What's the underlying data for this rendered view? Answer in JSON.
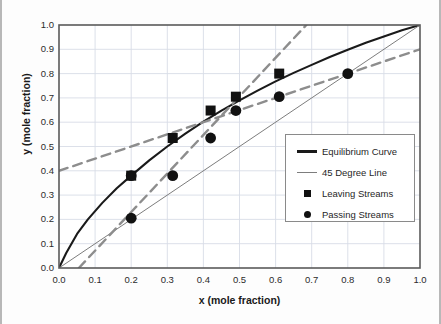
{
  "chart_data": {
    "type": "line",
    "title": "",
    "xlabel": "x (mole fraction)",
    "ylabel": "y (mole fraction)",
    "xlim": [
      0.0,
      1.0
    ],
    "ylim": [
      0.0,
      1.0
    ],
    "grid": true,
    "legend_position": "center-right",
    "xticks": [
      "0.0",
      "0.1",
      "0.2",
      "0.3",
      "0.4",
      "0.5",
      "0.6",
      "0.7",
      "0.8",
      "0.9",
      "1.0"
    ],
    "yticks": [
      "0.0",
      "0.1",
      "0.2",
      "0.3",
      "0.4",
      "0.5",
      "0.6",
      "0.7",
      "0.8",
      "0.9",
      "1.0"
    ],
    "xtick_values": [
      0.0,
      0.1,
      0.2,
      0.3,
      0.4,
      0.5,
      0.6,
      0.7,
      0.8,
      0.9,
      1.0
    ],
    "ytick_values": [
      0.0,
      0.1,
      0.2,
      0.3,
      0.4,
      0.5,
      0.6,
      0.7,
      0.8,
      0.9,
      1.0
    ],
    "series": [
      {
        "name": "Equilibrium Curve",
        "type": "line",
        "style": "solid",
        "color": "#1a1a1a",
        "width": 2.1,
        "x": [
          0.0,
          0.02,
          0.05,
          0.08,
          0.12,
          0.16,
          0.2,
          0.25,
          0.3,
          0.35,
          0.4,
          0.45,
          0.5,
          0.55,
          0.6,
          0.65,
          0.7,
          0.75,
          0.8,
          0.85,
          0.9,
          0.95,
          1.0
        ],
        "y": [
          0.0,
          0.062,
          0.14,
          0.2,
          0.268,
          0.328,
          0.38,
          0.443,
          0.5,
          0.553,
          0.602,
          0.648,
          0.69,
          0.73,
          0.768,
          0.803,
          0.836,
          0.868,
          0.898,
          0.927,
          0.953,
          0.978,
          1.0
        ]
      },
      {
        "name": "45 Degree Line",
        "type": "line",
        "style": "solid",
        "color": "#7d7d7d",
        "width": 1.0,
        "x": [
          0.0,
          1.0
        ],
        "y": [
          0.0,
          1.0
        ]
      },
      {
        "name": "Operating Line Upper",
        "type": "line",
        "style": "dashed",
        "color": "#8d8d8d",
        "width": 2.4,
        "x": [
          0.0,
          1.0
        ],
        "y": [
          0.4,
          0.9
        ]
      },
      {
        "name": "Operating Line Lower",
        "type": "line",
        "style": "dashed",
        "color": "#8d8d8d",
        "width": 2.4,
        "x": [
          0.055,
          0.685
        ],
        "y": [
          0.0,
          1.0
        ]
      },
      {
        "name": "Leaving Streams",
        "type": "scatter",
        "marker": "square",
        "color": "#111111",
        "x": [
          0.2,
          0.315,
          0.42,
          0.49,
          0.61
        ],
        "y": [
          0.38,
          0.535,
          0.648,
          0.705,
          0.8
        ]
      },
      {
        "name": "Passing Streams",
        "type": "scatter",
        "marker": "circle",
        "color": "#111111",
        "x": [
          0.2,
          0.2,
          0.315,
          0.42,
          0.49,
          0.61,
          0.8
        ],
        "y": [
          0.205,
          0.38,
          0.38,
          0.535,
          0.648,
          0.705,
          0.8
        ]
      }
    ]
  },
  "legend": {
    "items": [
      {
        "label": "Equilibrium Curve",
        "key": "thick-line-key"
      },
      {
        "label": "45 Degree Line",
        "key": "thin-line-key"
      },
      {
        "label": "Leaving Streams",
        "key": "square-marker-key"
      },
      {
        "label": "Passing Streams",
        "key": "circle-marker-key"
      }
    ]
  },
  "colors": {
    "equilibrium": "#1a1a1a",
    "diagonal": "#7d7d7d",
    "operating": "#8d8d8d",
    "marker": "#111111",
    "grid": "#d8dde6",
    "axis": "#5a5a5a",
    "background": "#fdfdfd"
  }
}
